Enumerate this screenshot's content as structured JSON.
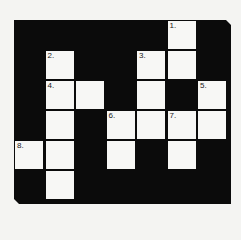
{
  "puzzle": {
    "type": "crossword",
    "rows": 6,
    "cols": 7,
    "colors": {
      "block": "#0b0b0b",
      "cell": "#f7f7f5",
      "background": "#f4f4f2"
    },
    "cells": [
      {
        "r": 0,
        "c": 5,
        "num": "1."
      },
      {
        "r": 1,
        "c": 1,
        "num": "2."
      },
      {
        "r": 1,
        "c": 4,
        "num": "3."
      },
      {
        "r": 1,
        "c": 5,
        "num": ""
      },
      {
        "r": 2,
        "c": 1,
        "num": "4."
      },
      {
        "r": 2,
        "c": 2,
        "num": ""
      },
      {
        "r": 2,
        "c": 4,
        "num": ""
      },
      {
        "r": 2,
        "c": 6,
        "num": "5."
      },
      {
        "r": 3,
        "c": 1,
        "num": ""
      },
      {
        "r": 3,
        "c": 3,
        "num": "6."
      },
      {
        "r": 3,
        "c": 4,
        "num": ""
      },
      {
        "r": 3,
        "c": 5,
        "num": "7."
      },
      {
        "r": 3,
        "c": 6,
        "num": ""
      },
      {
        "r": 4,
        "c": 0,
        "num": "8."
      },
      {
        "r": 4,
        "c": 1,
        "num": ""
      },
      {
        "r": 4,
        "c": 3,
        "num": ""
      },
      {
        "r": 4,
        "c": 5,
        "num": ""
      },
      {
        "r": 5,
        "c": 1,
        "num": ""
      }
    ]
  }
}
